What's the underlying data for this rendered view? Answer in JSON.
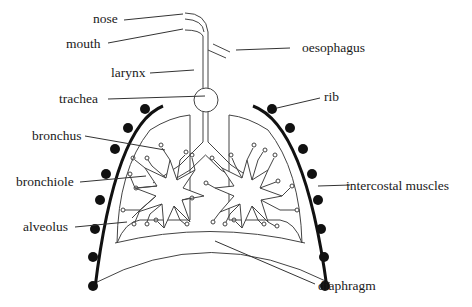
{
  "diagram": {
    "labels": {
      "nose": "nose",
      "mouth": "mouth",
      "larynx": "larynx",
      "trachea": "trachea",
      "bronchus": "bronchus",
      "bronchiole": "bronchiole",
      "alveolus": "alveolus",
      "oesophagus": "oesophagus",
      "rib": "rib",
      "intercostal_muscles": "intercostal muscles",
      "diaphragm": "diaphragm"
    },
    "colors": {
      "line": "#444444",
      "rib": "#111111",
      "text": "#1a1a1a",
      "background": "#ffffff"
    }
  }
}
